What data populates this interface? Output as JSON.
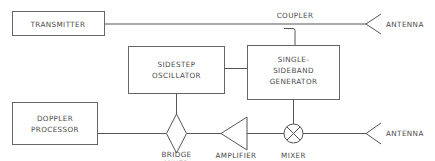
{
  "diagram": {
    "type": "block-diagram",
    "blocks": {
      "transmitter": {
        "label": "TRANSMITTER"
      },
      "sidestep_oscillator": {
        "line1": "SIDESTEP",
        "line2": "OSCILLATOR"
      },
      "ssb_generator": {
        "line1": "SINGLE-",
        "line2": "SIDEBAND",
        "line3": "GENERATOR"
      },
      "doppler_processor": {
        "line1": "DOPPLER",
        "line2": "PROCESSOR"
      }
    },
    "components": {
      "coupler": {
        "label": "COUPLER"
      },
      "bridge_mixer": {
        "line1": "BRIDGE",
        "line2": "MIXER"
      },
      "amplifier": {
        "label": "AMPLIFIER"
      },
      "mixer": {
        "label": "MIXER"
      },
      "antenna_top": {
        "label": "ANTENNA"
      },
      "antenna_bottom": {
        "label": "ANTENNA"
      }
    },
    "connections": [
      [
        "TRANSMITTER",
        "COUPLER",
        "ANTENNA"
      ],
      [
        "COUPLER",
        "SINGLE-SIDEBAND GENERATOR"
      ],
      [
        "SIDESTEP OSCILLATOR",
        "SINGLE-SIDEBAND GENERATOR"
      ],
      [
        "SIDESTEP OSCILLATOR",
        "BRIDGE MIXER"
      ],
      [
        "SINGLE-SIDEBAND GENERATOR",
        "MIXER"
      ],
      [
        "ANTENNA",
        "MIXER"
      ],
      [
        "MIXER",
        "AMPLIFIER"
      ],
      [
        "AMPLIFIER",
        "BRIDGE MIXER"
      ],
      [
        "BRIDGE MIXER",
        "DOPPLER PROCESSOR"
      ]
    ]
  }
}
